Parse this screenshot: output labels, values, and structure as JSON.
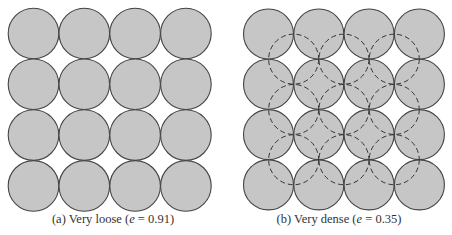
{
  "colors": {
    "fill": "#c6c6c6",
    "stroke": "#444444",
    "dashed": "#333333"
  },
  "panels": [
    {
      "id": "a",
      "caption_prefix": "(a) Very loose (",
      "caption_var": "e",
      "caption_eq": " = 0.91)",
      "grid": {
        "x0": 33.5,
        "y0": 33.5,
        "step": 50.8,
        "r": 25.3,
        "rows": 4,
        "cols": 4
      },
      "dashed": false
    },
    {
      "id": "b",
      "caption_prefix": "(b) Very dense (",
      "caption_var": "e",
      "caption_eq": " = 0.35)",
      "grid": {
        "x0": 268.5,
        "y0": 34,
        "step": 50.3,
        "r": 25.0,
        "rows": 4,
        "cols": 4
      },
      "dashed": true
    }
  ]
}
